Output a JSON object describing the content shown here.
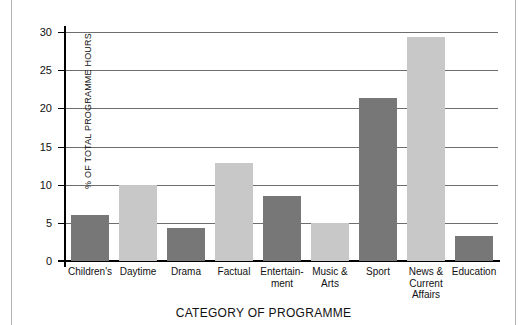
{
  "chart_data": {
    "type": "bar",
    "title": "",
    "subtitle": "",
    "xlabel": "CATEGORY OF PROGRAMME",
    "ylabel": "% OF TOTAL PROGRAMME HOURS",
    "ylim": [
      0,
      30
    ],
    "yticks": [
      0,
      5,
      10,
      15,
      20,
      25,
      30
    ],
    "ytick_labels": [
      "0",
      "5",
      "10",
      "15",
      "20",
      "25",
      "30"
    ],
    "grid": true,
    "legend": "none",
    "categories": [
      "Children's",
      "Daytime",
      "Drama",
      "Factual",
      "Entertain-\nment",
      "Music &\nArts",
      "Sport",
      "News &\nCurrent\nAffairs",
      "Education"
    ],
    "values": [
      6.0,
      10.0,
      4.3,
      12.9,
      8.5,
      5.0,
      21.4,
      29.4,
      3.3
    ],
    "bar_colors": [
      "#777777",
      "#c8c8c8",
      "#777777",
      "#c8c8c8",
      "#777777",
      "#c8c8c8",
      "#777777",
      "#c8c8c8",
      "#777777"
    ]
  },
  "colors": {
    "bar_dark": "#777777",
    "bar_light": "#c8c8c8",
    "gridline": "#6e6e6e",
    "axis": "#000000",
    "background": "#ffffff",
    "edge_rule": "#b4b4b4"
  }
}
